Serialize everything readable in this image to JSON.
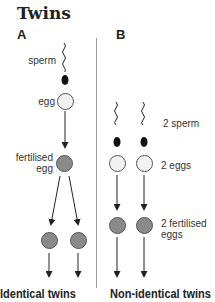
{
  "title": "Twins",
  "panel_a": {
    "label": "A",
    "labels": {
      "sperm": "sperm",
      "egg": "egg",
      "fertilised_egg_line1": "fertilised",
      "fertilised_egg_line2": "egg"
    },
    "caption": "Identical twins"
  },
  "panel_b": {
    "label": "B",
    "labels": {
      "sperm": "2 sperm",
      "eggs": "2 eggs",
      "fertilised_eggs_line1": "2 fertilised",
      "fertilised_eggs_line2": "eggs"
    },
    "caption": "Non-identical twins"
  },
  "colors": {
    "egg_fill": "#f2f2f2",
    "fertilised_fill": "#8a8a8a",
    "sperm": "#111111",
    "divider": "#999999"
  }
}
